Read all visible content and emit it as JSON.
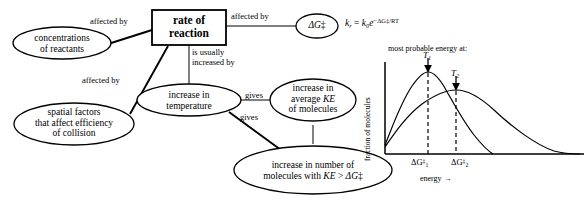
{
  "diagram": {
    "title_node": {
      "id": "rate-of-reaction",
      "shape": "rectangle",
      "line1": "rate of",
      "line2": "reaction"
    },
    "nodes": [
      {
        "id": "concentrations-of-reactants",
        "shape": "ellipse",
        "lines": [
          "concentrations",
          "of reactants"
        ]
      },
      {
        "id": "spatial-factors",
        "shape": "ellipse",
        "lines": [
          "spatial factors",
          "that affect efficiency",
          "of collision"
        ]
      },
      {
        "id": "increase-in-temperature",
        "shape": "ellipse",
        "lines": [
          "increase in",
          "temperature"
        ]
      },
      {
        "id": "increase-in-average-ke",
        "shape": "ellipse",
        "lines": [
          "increase in",
          "average KE",
          "of molecules"
        ]
      },
      {
        "id": "increase-in-number-of-molecules",
        "shape": "ellipse",
        "lines": [
          "increase in number of",
          "molecules with KE > ΔG‡"
        ]
      },
      {
        "id": "delta-g-double-dagger",
        "shape": "ellipse",
        "lines": [
          "ΔG‡"
        ]
      }
    ],
    "edges": [
      {
        "id": "edge-concentrations",
        "label": "affected by"
      },
      {
        "id": "edge-spatial",
        "label": "affected by"
      },
      {
        "id": "edge-delta-g",
        "label": "affected by"
      },
      {
        "id": "edge-temperature",
        "label_line1": "is usually",
        "label_line2": "increased by"
      },
      {
        "id": "edge-average-ke",
        "label": "gives"
      },
      {
        "id": "edge-number-molecules",
        "label": "gives"
      }
    ],
    "equation": {
      "id": "arrhenius-equation",
      "text": "k_r = k_0 e^(-ΔG‡/RT)",
      "k": "k",
      "k_sub": "r",
      "equals": " = ",
      "k0": "k",
      "k0_sub": "0",
      "e": "e",
      "exponent": "−ΔG‡/RT"
    }
  },
  "chart_data": {
    "type": "line",
    "title": "most probable energy at:",
    "xlabel": "energy →",
    "ylabel": "fraction of molecules",
    "grid": false,
    "legend": "none",
    "axis_ranges": {
      "x": [
        0,
        1
      ],
      "y": [
        0,
        1
      ]
    },
    "annotations": [
      {
        "id": "arrow-T1",
        "label": "T",
        "sub": "1",
        "points_to": "peak of T1 curve",
        "x": 0.245
      },
      {
        "id": "arrow-T2",
        "label": "T",
        "sub": "2",
        "points_to": "peak of T2 curve",
        "x": 0.4
      }
    ],
    "tick_labels": [
      {
        "id": "tick-dg1",
        "text": "ΔG‡₁",
        "base": "ΔG",
        "sup": "‡",
        "sub": "1",
        "x": 0.245
      },
      {
        "id": "tick-dg2",
        "text": "ΔG‡₂",
        "base": "ΔG",
        "sup": "‡",
        "sub": "2",
        "x": 0.4
      }
    ],
    "dashed_lines": [
      {
        "id": "dashed-dg1",
        "x": 0.245
      },
      {
        "id": "dashed-dg2",
        "x": 0.4
      }
    ],
    "series": [
      {
        "name": "T1",
        "description": "Maxwell-Boltzmann distribution at lower temperature T1: taller, narrower peak",
        "peak_x": 0.245,
        "peak_y": 0.93,
        "x": [
          0.0,
          0.03,
          0.06,
          0.1,
          0.14,
          0.18,
          0.22,
          0.245,
          0.28,
          0.32,
          0.37,
          0.43,
          0.5,
          0.57,
          0.64,
          0.72,
          0.8
        ],
        "y": [
          0.1,
          0.26,
          0.44,
          0.62,
          0.77,
          0.87,
          0.92,
          0.93,
          0.91,
          0.85,
          0.74,
          0.6,
          0.44,
          0.29,
          0.17,
          0.07,
          0.0
        ]
      },
      {
        "name": "T2",
        "description": "Maxwell-Boltzmann distribution at higher temperature T2: lower, broader peak, longer tail",
        "peak_x": 0.4,
        "peak_y": 0.72,
        "x": [
          0.0,
          0.04,
          0.09,
          0.15,
          0.22,
          0.29,
          0.35,
          0.4,
          0.47,
          0.55,
          0.63,
          0.72,
          0.82,
          0.92,
          1.0
        ],
        "y": [
          0.08,
          0.24,
          0.39,
          0.53,
          0.63,
          0.69,
          0.715,
          0.72,
          0.7,
          0.64,
          0.55,
          0.43,
          0.28,
          0.12,
          0.0
        ]
      }
    ]
  }
}
